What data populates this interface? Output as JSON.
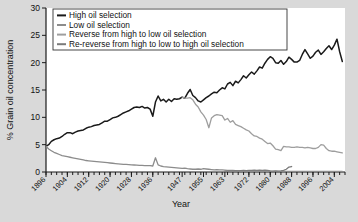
{
  "chart_data": {
    "type": "line",
    "title": "",
    "xlabel": "Year",
    "ylabel": "% Grain oil concentration",
    "ylim": [
      0,
      30
    ],
    "yticks": [
      0,
      5,
      10,
      15,
      20,
      25,
      30
    ],
    "xlim": [
      1896,
      2008
    ],
    "xticks": [
      1896,
      1904,
      1912,
      1920,
      1928,
      1936,
      1947,
      1955,
      1963,
      1972,
      1980,
      1988,
      1996,
      2004
    ],
    "xticklabels": [
      "1896",
      "1904",
      "1912",
      "1920",
      "1928",
      "1936",
      "1947",
      "1955",
      "1963",
      "1972",
      "1980",
      "1988",
      "1996",
      "2004"
    ],
    "grid": false,
    "legend_position": "upper-left",
    "series": [
      {
        "name": "High oil selection",
        "color": "#1a1a1a",
        "width": 1.5,
        "x": [
          1896,
          1897,
          1898,
          1899,
          1900,
          1901,
          1902,
          1903,
          1904,
          1905,
          1906,
          1907,
          1908,
          1909,
          1910,
          1911,
          1912,
          1913,
          1914,
          1915,
          1916,
          1917,
          1918,
          1919,
          1920,
          1921,
          1922,
          1923,
          1924,
          1925,
          1926,
          1927,
          1928,
          1929,
          1930,
          1931,
          1932,
          1933,
          1934,
          1935,
          1936,
          1937,
          1938,
          1939,
          1940,
          1941,
          1942,
          1943,
          1944,
          1945,
          1946,
          1947,
          1948,
          1949,
          1950,
          1951,
          1952,
          1953,
          1954,
          1955,
          1956,
          1957,
          1958,
          1959,
          1960,
          1961,
          1962,
          1963,
          1964,
          1965,
          1966,
          1967,
          1968,
          1969,
          1970,
          1971,
          1972,
          1973,
          1974,
          1975,
          1976,
          1977,
          1978,
          1979,
          1980,
          1981,
          1982,
          1983,
          1984,
          1985,
          1986,
          1987,
          1988,
          1989,
          1990,
          1991,
          1992,
          1993,
          1994,
          1995,
          1996,
          1997,
          1998,
          1999,
          2000,
          2001,
          2002,
          2003,
          2004,
          2005,
          2006,
          2007
        ],
        "y": [
          4.7,
          5.0,
          5.6,
          5.9,
          6.1,
          6.2,
          6.5,
          6.9,
          7.2,
          7.2,
          7.0,
          7.3,
          7.5,
          7.6,
          7.7,
          8.0,
          8.2,
          8.3,
          8.5,
          8.6,
          8.7,
          9.0,
          9.3,
          9.3,
          9.6,
          9.9,
          10.0,
          10.2,
          10.5,
          10.8,
          11.0,
          11.2,
          11.5,
          11.8,
          11.9,
          11.8,
          12.0,
          11.7,
          11.8,
          11.5,
          10.2,
          12.8,
          13.9,
          13.0,
          13.3,
          12.8,
          13.3,
          12.9,
          13.4,
          13.3,
          13.4,
          13.7,
          13.5,
          14.4,
          15.1,
          14.0,
          13.6,
          13.0,
          12.8,
          13.2,
          13.6,
          13.9,
          14.3,
          14.6,
          14.5,
          15.0,
          15.4,
          15.2,
          16.1,
          16.4,
          15.8,
          16.6,
          16.3,
          16.9,
          17.6,
          17.2,
          17.8,
          18.3,
          17.9,
          18.5,
          19.2,
          19.0,
          19.9,
          20.6,
          21.1,
          20.8,
          20.0,
          19.9,
          20.4,
          19.7,
          20.2,
          21.0,
          20.6,
          20.1,
          20.1,
          20.4,
          21.5,
          22.4,
          21.6,
          20.8,
          21.2,
          21.9,
          22.3,
          21.5,
          22.0,
          22.6,
          23.1,
          22.4,
          23.2,
          24.3,
          22.0,
          20.2
        ]
      },
      {
        "name": "Low oil selection",
        "color": "#8c8c8c",
        "width": 1.3,
        "x": [
          1896,
          1897,
          1898,
          1899,
          1900,
          1901,
          1902,
          1903,
          1904,
          1905,
          1906,
          1907,
          1908,
          1909,
          1910,
          1911,
          1912,
          1913,
          1914,
          1915,
          1916,
          1917,
          1918,
          1919,
          1920,
          1921,
          1922,
          1923,
          1924,
          1925,
          1926,
          1927,
          1928,
          1929,
          1930,
          1931,
          1932,
          1933,
          1934,
          1935,
          1936,
          1937,
          1938,
          1939,
          1940,
          1941,
          1942,
          1943,
          1944,
          1945,
          1946,
          1947,
          1948,
          1949,
          1950,
          1951,
          1952,
          1953,
          1954,
          1955,
          1956,
          1957,
          1958,
          1959,
          1960,
          1961,
          1962,
          1963,
          1964,
          1965,
          1966,
          1967,
          1968,
          1969,
          1970,
          1971,
          1972,
          1973,
          1974,
          1975,
          1976,
          1977,
          1978,
          1979,
          1980,
          1981,
          1982,
          1983,
          1984,
          1985,
          1986,
          1987,
          1988,
          1989,
          1990,
          1991,
          1992,
          1993,
          1994,
          1995,
          1996,
          1997,
          1998,
          1999,
          2000,
          2001,
          2002,
          2003,
          2004,
          2005,
          2006,
          2007
        ],
        "y": [
          4.7,
          4.2,
          3.9,
          3.6,
          3.4,
          3.2,
          3.0,
          2.9,
          2.8,
          2.7,
          2.6,
          2.5,
          2.4,
          2.3,
          2.2,
          2.1,
          2.05,
          2.0,
          1.95,
          1.9,
          1.85,
          1.8,
          1.75,
          1.7,
          1.65,
          1.6,
          1.55,
          1.5,
          1.45,
          1.4,
          1.38,
          1.35,
          1.3,
          1.28,
          1.25,
          1.2,
          1.2,
          1.18,
          1.15,
          1.15,
          1.1,
          2.6,
          1.3,
          1.1,
          1.0,
          0.95,
          0.9,
          0.85,
          0.8,
          0.75,
          0.7,
          0.65,
          0.7,
          0.6,
          0.55,
          0.5,
          0.5,
          0.55,
          0.5,
          0.6,
          0.55,
          0.5,
          0.45,
          0.4,
          0.45,
          0.4,
          0.38,
          0.35,
          0.3,
          0.3,
          0.28,
          0.25,
          0.25,
          0.22,
          0.2,
          0.2,
          0.18,
          0.18,
          0.15,
          0.15,
          0.12,
          0.12,
          0.1,
          0.1,
          0.1,
          0.1,
          0.1,
          0.1,
          0.1,
          0.1,
          0.1,
          0.1,
          0.1,
          0.1,
          0.1,
          0.1,
          0.1,
          0.1,
          0.1,
          0.1,
          0.1,
          0.1,
          0.1,
          0.1,
          0.1,
          0.1,
          0.1,
          0.1,
          0.1,
          0.1,
          0.1,
          0.1
        ]
      },
      {
        "name": "Reverse from high to low oil selection",
        "color": "#9e9e9e",
        "width": 1.3,
        "x": [
          1947,
          1948,
          1949,
          1950,
          1951,
          1952,
          1953,
          1954,
          1955,
          1956,
          1957,
          1958,
          1959,
          1960,
          1961,
          1962,
          1963,
          1964,
          1965,
          1966,
          1967,
          1968,
          1969,
          1970,
          1971,
          1972,
          1973,
          1974,
          1975,
          1976,
          1977,
          1978,
          1979,
          1980,
          1981,
          1982,
          1983,
          1984,
          1985,
          1986,
          1987,
          1988,
          1989,
          1990,
          1991,
          1992,
          1993,
          1994,
          1995,
          1996,
          1997,
          1998,
          1999,
          2000,
          2001,
          2002,
          2003,
          2004,
          2005,
          2006,
          2007
        ],
        "y": [
          13.7,
          13.5,
          13.5,
          13.6,
          13.2,
          12.4,
          11.9,
          11.0,
          10.4,
          9.6,
          8.1,
          9.9,
          10.3,
          10.5,
          10.4,
          10.3,
          9.5,
          9.8,
          9.1,
          9.4,
          8.7,
          8.5,
          8.3,
          8.0,
          7.7,
          7.5,
          7.0,
          6.6,
          6.5,
          6.2,
          6.0,
          5.6,
          5.2,
          5.3,
          4.8,
          4.2,
          4.1,
          3.9,
          4.7,
          4.6,
          4.6,
          4.5,
          4.5,
          4.6,
          4.5,
          4.5,
          4.4,
          4.5,
          4.4,
          4.3,
          4.3,
          4.5,
          5.0,
          4.9,
          4.3,
          3.9,
          3.8,
          3.8,
          3.7,
          3.6,
          3.5
        ]
      },
      {
        "name": "Re-reverse from high to low to high oil selection",
        "color": "#7a7a7a",
        "width": 1.3,
        "x": [
          1963,
          1964,
          1965,
          1966,
          1967,
          1968,
          1969,
          1970,
          1971,
          1972,
          1973,
          1974,
          1975,
          1976,
          1977,
          1978,
          1979,
          1980,
          1981,
          1982,
          1983,
          1984,
          1985,
          1986,
          1987,
          1988
        ],
        "y": [
          0.15,
          0.15,
          0.2,
          0.2,
          0.25,
          0.2,
          0.25,
          0.3,
          0.25,
          0.3,
          0.3,
          0.35,
          0.3,
          0.35,
          0.3,
          0.35,
          0.3,
          0.2,
          0.15,
          0.2,
          0.15,
          0.2,
          0.3,
          0.5,
          0.9,
          1.0
        ]
      }
    ]
  },
  "legend": {
    "items": [
      {
        "label": "High oil selection"
      },
      {
        "label": "Low oil selection"
      },
      {
        "label": "Reverse from high to low oil selection"
      },
      {
        "label": "Re-reverse from high to low to high oil selection"
      }
    ]
  }
}
